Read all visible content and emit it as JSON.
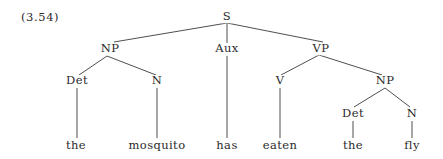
{
  "example_number": "(3.54)",
  "tree": {
    "nodes": {
      "S": {
        "label": "S",
        "x": 227,
        "y": 17
      },
      "NP1": {
        "label": "NP",
        "x": 110,
        "y": 49
      },
      "Aux": {
        "label": "Aux",
        "x": 227,
        "y": 49
      },
      "VP": {
        "label": "VP",
        "x": 321,
        "y": 49
      },
      "Det1": {
        "label": "Det",
        "x": 77,
        "y": 81
      },
      "N1": {
        "label": "N",
        "x": 157,
        "y": 81
      },
      "V": {
        "label": "V",
        "x": 280,
        "y": 81
      },
      "NP2": {
        "label": "NP",
        "x": 385,
        "y": 81
      },
      "Det2": {
        "label": "Det",
        "x": 353,
        "y": 114
      },
      "N2": {
        "label": "N",
        "x": 412,
        "y": 114
      },
      "the1": {
        "label": "the",
        "x": 76,
        "y": 146
      },
      "mosquito": {
        "label": "mosquito",
        "x": 157,
        "y": 146
      },
      "has": {
        "label": "has",
        "x": 227,
        "y": 146
      },
      "eaten": {
        "label": "eaten",
        "x": 280,
        "y": 146
      },
      "the2": {
        "label": "the",
        "x": 353,
        "y": 146
      },
      "fly": {
        "label": "fly",
        "x": 412,
        "y": 146
      }
    },
    "edges": [
      [
        "S",
        "NP1"
      ],
      [
        "S",
        "Aux"
      ],
      [
        "S",
        "VP"
      ],
      [
        "NP1",
        "Det1"
      ],
      [
        "NP1",
        "N1"
      ],
      [
        "VP",
        "V"
      ],
      [
        "VP",
        "NP2"
      ],
      [
        "NP2",
        "Det2"
      ],
      [
        "NP2",
        "N2"
      ],
      [
        "Det1",
        "the1"
      ],
      [
        "N1",
        "mosquito"
      ],
      [
        "Aux",
        "has"
      ],
      [
        "V",
        "eaten"
      ],
      [
        "Det2",
        "the2"
      ],
      [
        "N2",
        "fly"
      ]
    ]
  }
}
